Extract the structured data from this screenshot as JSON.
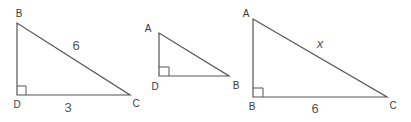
{
  "colors": {
    "stroke": "#555555",
    "text": "#3a3a3a",
    "background": "#ffffff"
  },
  "triangles": [
    {
      "id": "triangle-BDC",
      "vertices": [
        {
          "name": "B",
          "x": 17,
          "y": 23,
          "label_x": 19,
          "label_y": 14
        },
        {
          "name": "D",
          "x": 17,
          "y": 95,
          "label_x": 17,
          "label_y": 105
        },
        {
          "name": "C",
          "x": 130,
          "y": 95,
          "label_x": 136,
          "label_y": 104
        }
      ],
      "right_angle_at": "D",
      "sides": [
        {
          "between": "BC",
          "label": "6",
          "label_x": 76,
          "label_y": 45,
          "italic": false
        },
        {
          "between": "DC",
          "label": "3",
          "label_x": 68,
          "label_y": 107,
          "italic": false
        }
      ]
    },
    {
      "id": "triangle-ADB",
      "vertices": [
        {
          "name": "A",
          "x": 159,
          "y": 33,
          "label_x": 148,
          "label_y": 29
        },
        {
          "name": "D",
          "x": 159,
          "y": 76,
          "label_x": 155,
          "label_y": 87
        },
        {
          "name": "B",
          "x": 229,
          "y": 76,
          "label_x": 236,
          "label_y": 86
        }
      ],
      "right_angle_at": "D",
      "sides": []
    },
    {
      "id": "triangle-ABC",
      "vertices": [
        {
          "name": "A",
          "x": 253,
          "y": 19,
          "label_x": 246,
          "label_y": 14
        },
        {
          "name": "B",
          "x": 253,
          "y": 97,
          "label_x": 252,
          "label_y": 107
        },
        {
          "name": "C",
          "x": 387,
          "y": 97,
          "label_x": 393,
          "label_y": 106
        }
      ],
      "right_angle_at": "B",
      "sides": [
        {
          "between": "AC",
          "label": "x",
          "label_x": 320,
          "label_y": 43,
          "italic": true
        },
        {
          "between": "BC",
          "label": "6",
          "label_x": 315,
          "label_y": 108,
          "italic": false
        }
      ]
    }
  ]
}
